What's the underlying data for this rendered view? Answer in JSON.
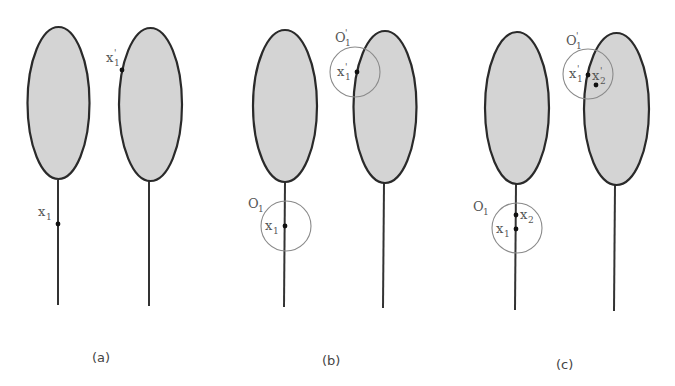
{
  "figure": {
    "panels": [
      {
        "caption": "(a)",
        "labels": {
          "x1": "x",
          "x1_sub": "1",
          "x1p": "x",
          "x1p_sub": "1",
          "prime": "'"
        }
      },
      {
        "caption": "(b)",
        "labels": {
          "O1": "O",
          "O1_sub": "1",
          "O1p": "O",
          "O1p_sub": "1",
          "x1": "x",
          "x1_sub": "1",
          "x1p": "x",
          "x1p_sub": "1",
          "prime": "'"
        }
      },
      {
        "caption": "(c)",
        "labels": {
          "O1": "O",
          "O1_sub": "1",
          "O1p": "O",
          "O1p_sub": "1",
          "x1": "x",
          "x1_sub": "1",
          "x2": "x",
          "x2_sub": "2",
          "x1p": "x",
          "x1p_sub": "1",
          "x2p": "x",
          "x2p_sub": "2",
          "prime": "'"
        }
      }
    ],
    "colors": {
      "fill": "#d4d4d4",
      "stroke": "#2a2a2a",
      "circle": "#8a8a8a"
    }
  }
}
